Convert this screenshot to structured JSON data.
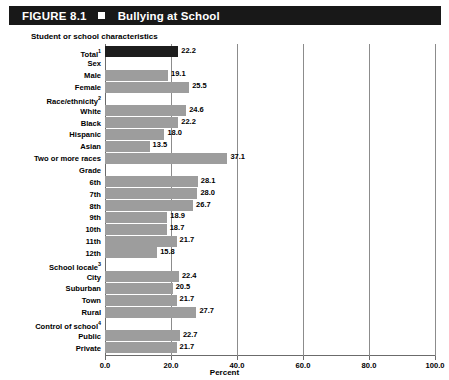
{
  "header": {
    "figure_number": "FIGURE 8.1",
    "square_icon": "black-square-icon",
    "title": "Bullying at School",
    "background_color": "#181818",
    "text_color": "#ffffff"
  },
  "subtitle": "Student or school characteristics",
  "axis": {
    "xlabel": "Percent",
    "ticks": [
      "0.0",
      "20.0",
      "40.0",
      "60.0",
      "80.0",
      "100.0"
    ],
    "tick_values": [
      0,
      20,
      40,
      60,
      80,
      100
    ]
  },
  "colors": {
    "total_bar": "#1d1d1d",
    "bar": "#9d9d9d",
    "gridline": "#8c8c8c",
    "axis": "#6b6b6b"
  },
  "chart_data": {
    "type": "bar",
    "orientation": "horizontal",
    "title": "Bullying at School",
    "subtitle": "Student or school characteristics",
    "xlabel": "Percent",
    "ylabel": "",
    "xlim": [
      0,
      100
    ],
    "grid": true,
    "legend": "none",
    "categories": [
      "Total",
      "Sex",
      "Male",
      "Female",
      "Race/ethnicity",
      "White",
      "Black",
      "Hispanic",
      "Asian",
      "Two or more races",
      "Grade",
      "6th",
      "7th",
      "8th",
      "9th",
      "10th",
      "11th",
      "12th",
      "School locale",
      "City",
      "Suburban",
      "Town",
      "Rural",
      "Control of school",
      "Public",
      "Private"
    ],
    "values": [
      22.2,
      null,
      19.1,
      25.5,
      null,
      24.6,
      22.2,
      18.0,
      13.5,
      37.1,
      null,
      28.1,
      28.0,
      26.7,
      18.9,
      18.7,
      21.7,
      15.8,
      null,
      22.4,
      20.5,
      21.7,
      27.7,
      null,
      22.7,
      21.7
    ]
  },
  "rows": [
    {
      "label": "Total",
      "sup": "1",
      "value": 22.2,
      "value_text": "22.2",
      "is_header": false,
      "highlight": true
    },
    {
      "label": "Sex",
      "sup": "",
      "value": null,
      "value_text": "",
      "is_header": true,
      "highlight": false
    },
    {
      "label": "Male",
      "sup": "",
      "value": 19.1,
      "value_text": "19.1",
      "is_header": false,
      "highlight": false
    },
    {
      "label": "Female",
      "sup": "",
      "value": 25.5,
      "value_text": "25.5",
      "is_header": false,
      "highlight": false
    },
    {
      "label": "Race/ethnicity",
      "sup": "2",
      "value": null,
      "value_text": "",
      "is_header": true,
      "highlight": false
    },
    {
      "label": "White",
      "sup": "",
      "value": 24.6,
      "value_text": "24.6",
      "is_header": false,
      "highlight": false
    },
    {
      "label": "Black",
      "sup": "",
      "value": 22.2,
      "value_text": "22.2",
      "is_header": false,
      "highlight": false
    },
    {
      "label": "Hispanic",
      "sup": "",
      "value": 18.0,
      "value_text": "18.0",
      "is_header": false,
      "highlight": false
    },
    {
      "label": "Asian",
      "sup": "",
      "value": 13.5,
      "value_text": "13.5",
      "is_header": false,
      "highlight": false
    },
    {
      "label": "Two or more races",
      "sup": "",
      "value": 37.1,
      "value_text": "37.1",
      "is_header": false,
      "highlight": false
    },
    {
      "label": "Grade",
      "sup": "",
      "value": null,
      "value_text": "",
      "is_header": true,
      "highlight": false
    },
    {
      "label": "6th",
      "sup": "",
      "value": 28.1,
      "value_text": "28.1",
      "is_header": false,
      "highlight": false
    },
    {
      "label": "7th",
      "sup": "",
      "value": 28.0,
      "value_text": "28.0",
      "is_header": false,
      "highlight": false
    },
    {
      "label": "8th",
      "sup": "",
      "value": 26.7,
      "value_text": "26.7",
      "is_header": false,
      "highlight": false
    },
    {
      "label": "9th",
      "sup": "",
      "value": 18.9,
      "value_text": "18.9",
      "is_header": false,
      "highlight": false
    },
    {
      "label": "10th",
      "sup": "",
      "value": 18.7,
      "value_text": "18.7",
      "is_header": false,
      "highlight": false
    },
    {
      "label": "11th",
      "sup": "",
      "value": 21.7,
      "value_text": "21.7",
      "is_header": false,
      "highlight": false
    },
    {
      "label": "12th",
      "sup": "",
      "value": 15.8,
      "value_text": "15.8",
      "is_header": false,
      "highlight": false
    },
    {
      "label": "School locale",
      "sup": "3",
      "value": null,
      "value_text": "",
      "is_header": true,
      "highlight": false
    },
    {
      "label": "City",
      "sup": "",
      "value": 22.4,
      "value_text": "22.4",
      "is_header": false,
      "highlight": false
    },
    {
      "label": "Suburban",
      "sup": "",
      "value": 20.5,
      "value_text": "20.5",
      "is_header": false,
      "highlight": false
    },
    {
      "label": "Town",
      "sup": "",
      "value": 21.7,
      "value_text": "21.7",
      "is_header": false,
      "highlight": false
    },
    {
      "label": "Rural",
      "sup": "",
      "value": 27.7,
      "value_text": "27.7",
      "is_header": false,
      "highlight": false
    },
    {
      "label": "Control of school",
      "sup": "4",
      "value": null,
      "value_text": "",
      "is_header": true,
      "highlight": false
    },
    {
      "label": "Public",
      "sup": "",
      "value": 22.7,
      "value_text": "22.7",
      "is_header": false,
      "highlight": false
    },
    {
      "label": "Private",
      "sup": "",
      "value": 21.7,
      "value_text": "21.7",
      "is_header": false,
      "highlight": false
    }
  ]
}
